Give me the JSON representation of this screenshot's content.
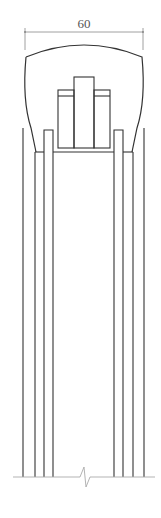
{
  "drawing": {
    "type": "technical-section",
    "dimension": {
      "label": "60",
      "from_x": 25,
      "to_x": 143,
      "y": 32
    },
    "break_symbol": "zigzag-break",
    "colors": {
      "line": "#333333",
      "dimension_line": "#888888",
      "dimension_text": "#555555",
      "background": "#ffffff"
    },
    "vertical_lines": {
      "left": [
        23,
        35,
        44,
        53
      ],
      "right": [
        114,
        123,
        133,
        144
      ],
      "bottom_y": 477
    }
  }
}
